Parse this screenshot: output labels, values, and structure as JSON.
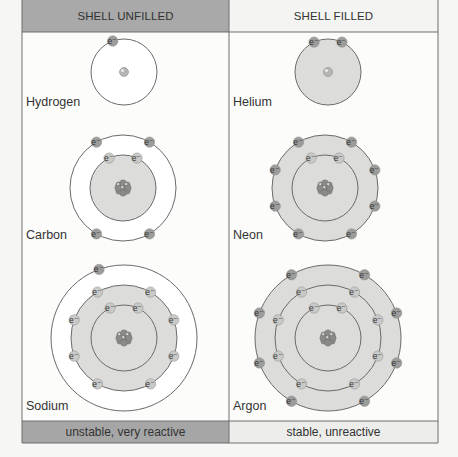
{
  "header": {
    "left": "SHELL UNFILLED",
    "right": "SHELL FILLED"
  },
  "footer": {
    "left": "unstable, very reactive",
    "right": "stable, unreactive"
  },
  "colors": {
    "header_left_bg": "#a9a9a9",
    "header_right_bg": "#f4f4f2",
    "footer_left_bg": "#a6a6a6",
    "footer_right_bg": "#ededeb",
    "shell_fill": "#dcdcda",
    "line": "#6a6a6a",
    "electron": "#9c9c9a",
    "nucleus": "#8a8a88"
  },
  "electron_symbol": "e⁻",
  "atoms": [
    {
      "name": "Hydrogen",
      "column": "unfilled",
      "shells": [
        1
      ]
    },
    {
      "name": "Helium",
      "column": "filled",
      "shells": [
        2
      ]
    },
    {
      "name": "Carbon",
      "column": "unfilled",
      "shells": [
        2,
        4
      ]
    },
    {
      "name": "Neon",
      "column": "filled",
      "shells": [
        2,
        8
      ]
    },
    {
      "name": "Sodium",
      "column": "unfilled",
      "shells": [
        2,
        8,
        1
      ]
    },
    {
      "name": "Argon",
      "column": "filled",
      "shells": [
        2,
        8,
        8
      ]
    }
  ]
}
